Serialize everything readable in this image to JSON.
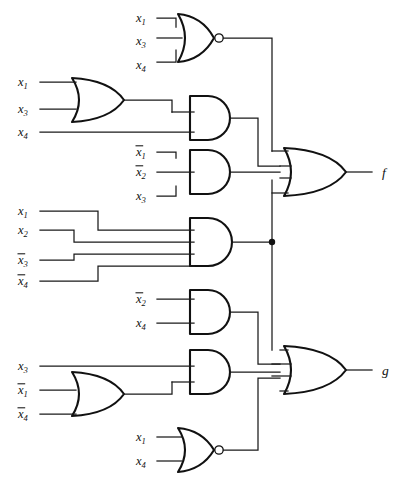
{
  "diagram": {
    "type": "logic-circuit-schematic",
    "width": 405,
    "height": 480,
    "line_color": "#111111",
    "background": "#ffffff"
  },
  "outputs": [
    {
      "id": "f",
      "label": "f",
      "x": 382,
      "y": 172
    },
    {
      "id": "g",
      "label": "g",
      "x": 382,
      "y": 370
    }
  ],
  "gates": [
    {
      "id": "nor-top",
      "type": "NOR",
      "inputs": [
        "x1",
        "x3",
        "x4"
      ],
      "inverted_inputs": [
        false,
        false,
        false
      ],
      "feeds": "f",
      "x": 178,
      "y": 38
    },
    {
      "id": "or-a",
      "type": "OR",
      "inputs": [
        "x1",
        "x3"
      ],
      "inverted_inputs": [
        false,
        false
      ],
      "feeds": "and-a",
      "x": 72,
      "y": 100
    },
    {
      "id": "and-a",
      "type": "AND",
      "inputs": [
        "or-a",
        "x4"
      ],
      "inverted_inputs": [
        false,
        false
      ],
      "feeds": "f",
      "x": 218,
      "y": 118
    },
    {
      "id": "and-b",
      "type": "AND",
      "inputs": [
        "x1",
        "x2",
        "x3"
      ],
      "inverted_inputs": [
        true,
        true,
        false
      ],
      "feeds": "f",
      "x": 218,
      "y": 172
    },
    {
      "id": "and-c",
      "type": "AND",
      "inputs": [
        "x1",
        "x2",
        "x3",
        "x4"
      ],
      "inverted_inputs": [
        false,
        false,
        true,
        true
      ],
      "feeds": "f,g",
      "x": 218,
      "y": 242
    },
    {
      "id": "and-d",
      "type": "AND",
      "inputs": [
        "x2",
        "x4"
      ],
      "inverted_inputs": [
        true,
        false
      ],
      "feeds": "g",
      "x": 218,
      "y": 312
    },
    {
      "id": "or-b",
      "type": "OR",
      "inputs": [
        "x1",
        "x4"
      ],
      "inverted_inputs": [
        true,
        true
      ],
      "feeds": "and-e",
      "x": 72,
      "y": 394
    },
    {
      "id": "and-e",
      "type": "AND",
      "inputs": [
        "x3",
        "or-b"
      ],
      "inverted_inputs": [
        false,
        false
      ],
      "feeds": "g",
      "x": 218,
      "y": 372
    },
    {
      "id": "nor-bot",
      "type": "NOR",
      "inputs": [
        "x1",
        "x4"
      ],
      "inverted_inputs": [
        false,
        false
      ],
      "feeds": "g",
      "x": 178,
      "y": 450
    },
    {
      "id": "or-f",
      "type": "OR",
      "inputs": [
        "nor-top",
        "and-a",
        "and-b",
        "and-c"
      ],
      "feeds": "f",
      "x": 290,
      "y": 172
    },
    {
      "id": "or-g",
      "type": "OR",
      "inputs": [
        "and-c",
        "and-d",
        "and-e",
        "nor-bot"
      ],
      "feeds": "g",
      "x": 290,
      "y": 370
    }
  ],
  "input_labels": [
    {
      "id": "n1-x1",
      "var": "x",
      "sub": "1",
      "bar": false,
      "x": 136,
      "y": 18
    },
    {
      "id": "n1-x3",
      "var": "x",
      "sub": "3",
      "bar": false,
      "x": 136,
      "y": 41
    },
    {
      "id": "n1-x4",
      "var": "x",
      "sub": "4",
      "bar": false,
      "x": 136,
      "y": 65
    },
    {
      "id": "o1-x1",
      "var": "x",
      "sub": "1",
      "bar": false,
      "x": 18,
      "y": 82
    },
    {
      "id": "o1-x3",
      "var": "x",
      "sub": "3",
      "bar": false,
      "x": 18,
      "y": 109
    },
    {
      "id": "a1-x4",
      "var": "x",
      "sub": "4",
      "bar": false,
      "x": 18,
      "y": 132
    },
    {
      "id": "b-x1",
      "var": "x",
      "sub": "1",
      "bar": true,
      "x": 136,
      "y": 152
    },
    {
      "id": "b-x2",
      "var": "x",
      "sub": "2",
      "bar": true,
      "x": 136,
      "y": 172
    },
    {
      "id": "b-x3",
      "var": "x",
      "sub": "3",
      "bar": false,
      "x": 136,
      "y": 196
    },
    {
      "id": "c-x1",
      "var": "x",
      "sub": "1",
      "bar": false,
      "x": 18,
      "y": 211
    },
    {
      "id": "c-x2",
      "var": "x",
      "sub": "2",
      "bar": false,
      "x": 18,
      "y": 230
    },
    {
      "id": "c-x3",
      "var": "x",
      "sub": "3",
      "bar": true,
      "x": 18,
      "y": 260
    },
    {
      "id": "c-x4",
      "var": "x",
      "sub": "4",
      "bar": true,
      "x": 18,
      "y": 281
    },
    {
      "id": "d-x2",
      "var": "x",
      "sub": "2",
      "bar": true,
      "x": 136,
      "y": 299
    },
    {
      "id": "d-x4",
      "var": "x",
      "sub": "4",
      "bar": false,
      "x": 136,
      "y": 323
    },
    {
      "id": "e-x3",
      "var": "x",
      "sub": "3",
      "bar": false,
      "x": 18,
      "y": 366
    },
    {
      "id": "o2-x1",
      "var": "x",
      "sub": "1",
      "bar": true,
      "x": 18,
      "y": 390
    },
    {
      "id": "o2-x4",
      "var": "x",
      "sub": "4",
      "bar": true,
      "x": 18,
      "y": 414
    },
    {
      "id": "n2-x1",
      "var": "x",
      "sub": "1",
      "bar": false,
      "x": 136,
      "y": 437
    },
    {
      "id": "n2-x4",
      "var": "x",
      "sub": "4",
      "bar": false,
      "x": 136,
      "y": 461
    }
  ]
}
